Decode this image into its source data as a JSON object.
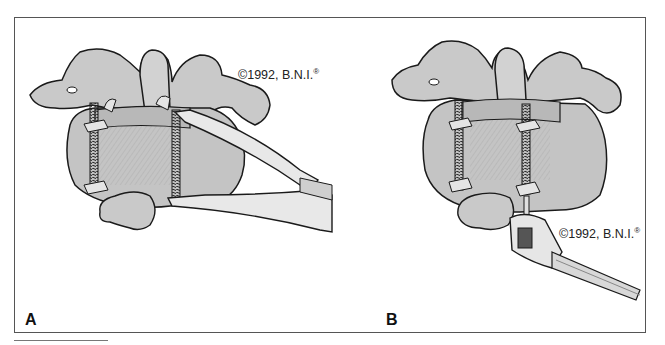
{
  "figure": {
    "panels": [
      {
        "label": "A",
        "copyright": "©1992, B.N.I.",
        "registered_mark": "®",
        "depiction": "vertebrae with interspinous clamp (threaded rods) being compressed by pliers"
      },
      {
        "label": "B",
        "copyright": "©1992, B.N.I.",
        "registered_mark": "®",
        "depiction": "vertebrae with interspinous clamp being tightened by wrench"
      }
    ],
    "colors": {
      "bone_fill": "#c9c9c9",
      "bone_shadow": "#9a9a9a",
      "outline": "#1a1a1a",
      "frame": "#555555",
      "background": "#ffffff",
      "metal": "#dcdcdc"
    }
  }
}
